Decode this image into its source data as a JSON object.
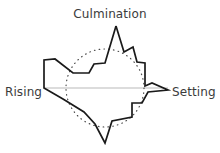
{
  "figure": {
    "title_label": "Culmination",
    "left_label": "Rising",
    "right_label": "Setting",
    "colors": {
      "path_stroke": "#1a1a1a",
      "circle_stroke": "#4a4a4a",
      "axis_stroke": "#b9b9b9",
      "text_fill": "#3b3b3b",
      "background": "#ffffff"
    }
  },
  "chart_data": {
    "type": "line",
    "title": "Culmination",
    "xlabel": "",
    "ylabel": "",
    "grid": false,
    "legend": null,
    "annotations": [
      {
        "text": "Culmination",
        "position": "top-center",
        "x": 110,
        "y": 14
      },
      {
        "text": "Rising",
        "position": "left",
        "x": 5,
        "y": 92
      },
      {
        "text": "Setting",
        "position": "right",
        "x": 172,
        "y": 92
      }
    ],
    "reference_circle": {
      "label": "dotted reference circle",
      "center_x": 105,
      "center_y": 88,
      "radius": 39,
      "style": "dotted"
    },
    "horizon_axis": {
      "label": "horizon line",
      "x_start": 44,
      "x_end": 168,
      "y": 88,
      "style": "solid-gray"
    },
    "series": [
      {
        "name": "celestial path outline",
        "closed": true,
        "points": [
          [
            116,
            26
          ],
          [
            124,
            52
          ],
          [
            133,
            47
          ],
          [
            137,
            62
          ],
          [
            145,
            63
          ],
          [
            145,
            86
          ],
          [
            152,
            83
          ],
          [
            168,
            90
          ],
          [
            148,
            92
          ],
          [
            142,
            103
          ],
          [
            132,
            103
          ],
          [
            132,
            117
          ],
          [
            112,
            121
          ],
          [
            105,
            143
          ],
          [
            95,
            124
          ],
          [
            84,
            112
          ],
          [
            63,
            99
          ],
          [
            44,
            88
          ],
          [
            44,
            60
          ],
          [
            55,
            59
          ],
          [
            73,
            73
          ],
          [
            89,
            73
          ],
          [
            94,
            64
          ],
          [
            105,
            63
          ],
          [
            116,
            26
          ]
        ]
      }
    ]
  }
}
